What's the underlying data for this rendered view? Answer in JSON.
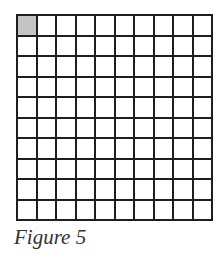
{
  "figure": {
    "caption": "Figure 5",
    "grid": {
      "rows": 10,
      "columns": 10,
      "shaded_cells": [
        [
          0,
          0
        ]
      ],
      "line_color": "#1e1e1e",
      "shade_color": "#c4c4c4",
      "cell_color": "#ffffff"
    }
  }
}
